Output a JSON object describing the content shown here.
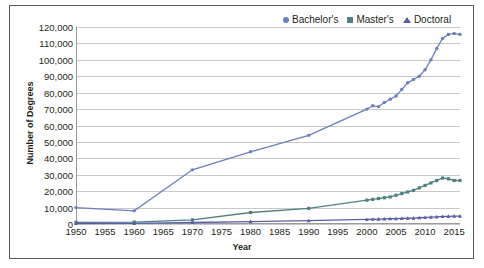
{
  "chart_data": {
    "type": "line",
    "title": "",
    "xlabel": "Year",
    "ylabel": "Number of Degrees",
    "xlim": [
      1950,
      2016
    ],
    "ylim": [
      0,
      120000
    ],
    "ytick_labels": [
      "120,000",
      "110,000",
      "100,000",
      "90,000",
      "80,000",
      "70,000",
      "60,000",
      "50,000",
      "40,000",
      "30,000",
      "20,000",
      "10,000",
      "0"
    ],
    "ytick_values": [
      120000,
      110000,
      100000,
      90000,
      80000,
      70000,
      60000,
      50000,
      40000,
      30000,
      20000,
      10000,
      0
    ],
    "xtick_labels": [
      "1950",
      "1955",
      "1960",
      "1965",
      "1970",
      "1975",
      "1980",
      "1985",
      "1990",
      "1995",
      "2000",
      "2005",
      "2010",
      "2015"
    ],
    "xtick_values": [
      1950,
      1955,
      1960,
      1965,
      1970,
      1975,
      1980,
      1985,
      1990,
      1995,
      2000,
      2005,
      2010,
      2015
    ],
    "grid": true,
    "legend_position": "top-right",
    "series": [
      {
        "name": "Bachelor's",
        "color": "#6b7fc0",
        "marker": "circle",
        "x": [
          1950,
          1960,
          1970,
          1980,
          1990,
          2000,
          2001,
          2002,
          2003,
          2004,
          2005,
          2006,
          2007,
          2008,
          2009,
          2010,
          2011,
          2012,
          2013,
          2014,
          2015,
          2016
        ],
        "values": [
          10000,
          8000,
          33000,
          44000,
          54000,
          70000,
          72000,
          71500,
          74000,
          76000,
          78000,
          82000,
          86000,
          88000,
          90000,
          94000,
          100000,
          107000,
          113000,
          115500,
          116000,
          115500
        ]
      },
      {
        "name": "Master's",
        "color": "#4f7f82",
        "marker": "square",
        "x": [
          1950,
          1960,
          1970,
          1980,
          1990,
          2000,
          2001,
          2002,
          2003,
          2004,
          2005,
          2006,
          2007,
          2008,
          2009,
          2010,
          2011,
          2012,
          2013,
          2014,
          2015,
          2016
        ],
        "values": [
          1000,
          1200,
          2500,
          7000,
          9500,
          14500,
          15000,
          15500,
          16000,
          16500,
          17500,
          18500,
          19500,
          20500,
          22000,
          23500,
          25000,
          26500,
          28000,
          27500,
          26500,
          26500
        ]
      },
      {
        "name": "Doctoral",
        "color": "#5b5ea6",
        "marker": "triangle",
        "x": [
          1950,
          1960,
          1970,
          1980,
          1990,
          2000,
          2001,
          2002,
          2003,
          2004,
          2005,
          2006,
          2007,
          2008,
          2009,
          2010,
          2011,
          2012,
          2013,
          2014,
          2015,
          2016
        ],
        "values": [
          300,
          400,
          900,
          1500,
          2000,
          2800,
          2900,
          3000,
          3100,
          3200,
          3300,
          3400,
          3500,
          3600,
          3800,
          4000,
          4200,
          4400,
          4600,
          4700,
          4800,
          4800
        ]
      }
    ]
  }
}
